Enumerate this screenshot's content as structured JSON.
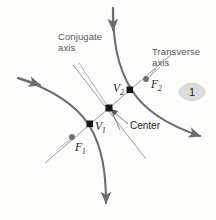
{
  "figure": {
    "badge": {
      "label": "1"
    },
    "labels": {
      "conjugate_axis": "Conjugate\naxis",
      "transverse_axis": "Transverse\naxis",
      "center": "Center",
      "vertex_1": "V",
      "vertex_1_sub": "1",
      "vertex_2": "V",
      "vertex_2_sub": "2",
      "focus_1": "F",
      "focus_1_sub": "1",
      "focus_2": "F",
      "focus_2_sub": "2"
    },
    "colors": {
      "background": "#fdfdfc",
      "curve": "#6e6e70",
      "axis_line": "#8d8d8f",
      "leader_line": "#9a9a9c",
      "point_marker": "#161616",
      "focus_marker": "#6e6e70",
      "label_gray": "#58585a",
      "label_dark": "#1c1c1c",
      "badge_fill": "#dcdcdc"
    },
    "geometry": {
      "center_point": [
        109,
        108
      ],
      "vertex_1_point": [
        90,
        124
      ],
      "vertex_2_point": [
        130,
        90
      ],
      "focus_1_point": [
        72,
        137
      ],
      "focus_2_point": [
        146,
        79
      ],
      "transverse_axis_endpoints": [
        [
          45,
          163
        ],
        [
          172,
          54
        ]
      ],
      "conjugate_axis_endpoints": [
        [
          73,
          65
        ],
        [
          146,
          159
        ]
      ],
      "arrow_top": [
        113,
        4
      ],
      "arrow_bottom": [
        105,
        207
      ],
      "arrow_left": [
        14,
        75
      ],
      "arrow_right": [
        204,
        138
      ]
    }
  }
}
